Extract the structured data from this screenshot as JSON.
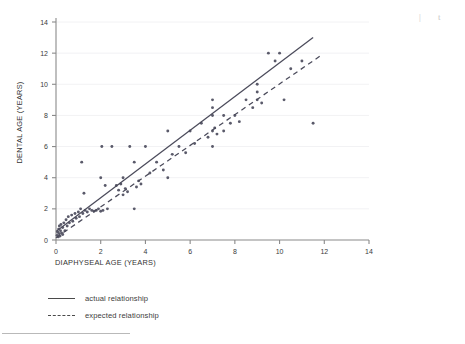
{
  "chart_data": {
    "type": "scatter",
    "title": "",
    "xlabel": "DIAPHYSEAL AGE (YEARS)",
    "ylabel": "DENTAL AGE (YEARS)",
    "xlim": [
      0,
      14
    ],
    "ylim": [
      0,
      14
    ],
    "xticks": [
      0,
      2,
      4,
      6,
      8,
      10,
      12,
      14
    ],
    "yticks": [
      0,
      2,
      4,
      6,
      8,
      10,
      12,
      14
    ],
    "xtick_labels": [
      "0",
      "2",
      "4",
      "6",
      "8",
      "10",
      "12",
      "14"
    ],
    "ytick_labels": [
      "0",
      "2",
      "4",
      "6",
      "8",
      "10",
      "12",
      "14"
    ],
    "grid": "horizontal-faint",
    "legend_position": "below-plot-left",
    "points": [
      [
        0.05,
        0.3
      ],
      [
        0.08,
        0.5
      ],
      [
        0.1,
        0.2
      ],
      [
        0.12,
        0.7
      ],
      [
        0.15,
        0.4
      ],
      [
        0.15,
        0.9
      ],
      [
        0.18,
        0.25
      ],
      [
        0.2,
        0.6
      ],
      [
        0.22,
        1.0
      ],
      [
        0.25,
        0.45
      ],
      [
        0.3,
        0.8
      ],
      [
        0.3,
        0.35
      ],
      [
        0.35,
        1.1
      ],
      [
        0.4,
        0.6
      ],
      [
        0.45,
        1.3
      ],
      [
        0.5,
        0.9
      ],
      [
        0.55,
        1.5
      ],
      [
        0.6,
        1.1
      ],
      [
        0.7,
        1.6
      ],
      [
        0.75,
        1.2
      ],
      [
        0.85,
        1.7
      ],
      [
        0.9,
        1.4
      ],
      [
        1.0,
        1.8
      ],
      [
        1.05,
        1.5
      ],
      [
        1.1,
        2.0
      ],
      [
        1.15,
        5.0
      ],
      [
        1.2,
        1.7
      ],
      [
        1.25,
        3.0
      ],
      [
        1.3,
        1.9
      ],
      [
        1.4,
        1.8
      ],
      [
        1.5,
        2.0
      ],
      [
        1.6,
        1.9
      ],
      [
        1.7,
        1.85
      ],
      [
        1.8,
        1.9
      ],
      [
        1.9,
        2.0
      ],
      [
        2.0,
        1.85
      ],
      [
        2.0,
        4.0
      ],
      [
        2.05,
        6.0
      ],
      [
        2.1,
        1.9
      ],
      [
        2.2,
        3.5
      ],
      [
        2.3,
        2.0
      ],
      [
        2.5,
        6.0
      ],
      [
        2.7,
        3.5
      ],
      [
        2.8,
        3.2
      ],
      [
        2.9,
        3.6
      ],
      [
        3.0,
        4.0
      ],
      [
        3.0,
        2.9
      ],
      [
        3.1,
        3.3
      ],
      [
        3.2,
        3.1
      ],
      [
        3.3,
        6.0
      ],
      [
        3.5,
        5.0
      ],
      [
        3.5,
        2.0
      ],
      [
        3.6,
        3.4
      ],
      [
        3.7,
        3.8
      ],
      [
        3.8,
        3.6
      ],
      [
        4.0,
        6.0
      ],
      [
        4.2,
        4.3
      ],
      [
        4.5,
        5.0
      ],
      [
        4.8,
        4.5
      ],
      [
        5.0,
        4.0
      ],
      [
        5.0,
        7.0
      ],
      [
        5.2,
        5.5
      ],
      [
        5.5,
        6.0
      ],
      [
        5.8,
        5.6
      ],
      [
        6.0,
        7.0
      ],
      [
        6.2,
        6.2
      ],
      [
        6.5,
        7.5
      ],
      [
        6.8,
        6.6
      ],
      [
        7.0,
        6.0
      ],
      [
        7.0,
        7.0
      ],
      [
        7.0,
        8.0
      ],
      [
        7.0,
        8.5
      ],
      [
        7.0,
        9.0
      ],
      [
        7.1,
        7.2
      ],
      [
        7.2,
        6.8
      ],
      [
        7.5,
        8.0
      ],
      [
        7.5,
        7.0
      ],
      [
        7.8,
        7.5
      ],
      [
        8.0,
        8.0
      ],
      [
        8.2,
        7.6
      ],
      [
        8.5,
        9.0
      ],
      [
        8.8,
        8.5
      ],
      [
        9.0,
        9.0
      ],
      [
        9.0,
        9.5
      ],
      [
        9.0,
        10.0
      ],
      [
        9.2,
        8.8
      ],
      [
        9.5,
        12.0
      ],
      [
        9.8,
        11.5
      ],
      [
        10.0,
        12.0
      ],
      [
        10.2,
        9.0
      ],
      [
        10.5,
        11.0
      ],
      [
        11.0,
        11.5
      ],
      [
        11.5,
        7.5
      ]
    ],
    "series": [
      {
        "name": "actual relationship",
        "style": "solid",
        "x0": 0.0,
        "y0": 0.55,
        "x1": 11.5,
        "y1": 13.0
      },
      {
        "name": "expected relationship",
        "style": "dashed",
        "x0": 0.0,
        "y0": 0.15,
        "x1": 11.8,
        "y1": 11.8
      }
    ],
    "legend": [
      {
        "label": "actual relationship",
        "style": "solid"
      },
      {
        "label": "expected relationship",
        "style": "dashed"
      }
    ],
    "colors": {
      "point": "#5a5a6a",
      "axis": "#8a8a8a",
      "actual_line": "#4a4a5a",
      "expected_line": "#4a4a5a",
      "grid": "#f2f2f4",
      "text": "#3a3a3a"
    }
  },
  "artifacts": {
    "bar": "|",
    "char": "t"
  }
}
